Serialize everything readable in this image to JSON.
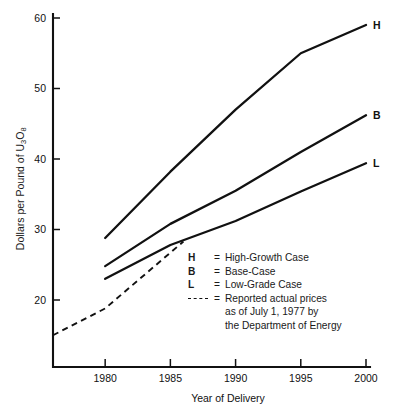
{
  "chart_data": {
    "type": "line",
    "title": "",
    "xlabel": "Year of Delivery",
    "ylabel": "Dollars per Pound of U3O8",
    "ylabel_parts": {
      "pre": "Dollars per Pound of U",
      "sub1": "3",
      "mid": "O",
      "sub2": "8"
    },
    "xlim": [
      1976,
      2000
    ],
    "ylim": [
      12,
      61
    ],
    "xticks": [
      1980,
      1985,
      1990,
      1995,
      2000
    ],
    "xticklabels": [
      "1980",
      "1985",
      "1990",
      "1995",
      "2000"
    ],
    "yticks": [
      20,
      30,
      40,
      50,
      60
    ],
    "yticklabels": [
      "20",
      "30",
      "40",
      "50",
      "60"
    ],
    "grid": false,
    "legend_position": "inside-center-right",
    "series": [
      {
        "name": "High-Growth Case",
        "key": "H",
        "style": "solid",
        "end_label": "H",
        "x": [
          1980,
          1985,
          1990,
          1995,
          2000
        ],
        "values": [
          28.8,
          38.2,
          47.0,
          55.0,
          59.0
        ]
      },
      {
        "name": "Base-Case",
        "key": "B",
        "style": "solid",
        "end_label": "B",
        "x": [
          1980,
          1985,
          1990,
          1995,
          2000
        ],
        "values": [
          24.8,
          30.8,
          35.5,
          41.0,
          46.2
        ]
      },
      {
        "name": "Low-Grade Case",
        "key": "L",
        "style": "solid",
        "end_label": "L",
        "x": [
          1980,
          1985,
          1990,
          1995,
          2000
        ],
        "values": [
          23.0,
          27.8,
          31.2,
          35.4,
          39.4
        ]
      },
      {
        "name": "Reported actual prices",
        "key": "dashed",
        "style": "dashed",
        "end_label": "",
        "x": [
          1976,
          1980,
          1986
        ],
        "values": [
          15.0,
          18.8,
          28.3
        ]
      }
    ]
  },
  "legend": {
    "items": [
      {
        "key": "H",
        "eq": "=",
        "text": "High-Growth Case"
      },
      {
        "key": "B",
        "eq": "=",
        "text": "Base-Case"
      },
      {
        "key": "L",
        "eq": "=",
        "text": "Low-Grade Case"
      },
      {
        "key": "dash",
        "eq": "=",
        "text": "Reported actual prices\nas of July 1, 1977 by\nthe Department of Energy"
      }
    ]
  },
  "axes": {
    "x_title": "Year of Delivery"
  }
}
